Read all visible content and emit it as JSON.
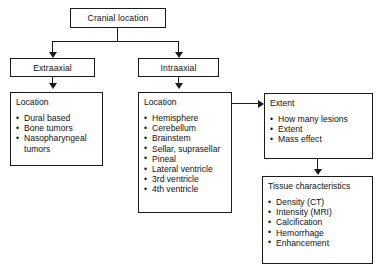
{
  "diagram": {
    "colors": {
      "stroke": "#1b1b1b",
      "text": "#111111",
      "background": "#ffffff"
    },
    "root": {
      "label": "Cranial location"
    },
    "branches": [
      {
        "label": "Extraaxial"
      },
      {
        "label": "Intraaxial"
      }
    ],
    "extraaxial_location": {
      "heading": "Location",
      "items": [
        "Dural based",
        "Bone tumors",
        "Nasopharyngeal tumors"
      ]
    },
    "intraaxial_location": {
      "heading": "Location",
      "items": [
        "Hemisphere",
        "Cerebellum",
        "Brainstem",
        "Sellar, suprasellar",
        "Pineal",
        "Lateral ventricle",
        "3rd ventricle",
        "4th ventricle"
      ]
    },
    "extent": {
      "heading": "Extent",
      "items": [
        "How many lesions",
        "Extent",
        "Mass effect"
      ]
    },
    "tissue_characteristics": {
      "heading": "Tissue characteristics",
      "items": [
        "Density (CT)",
        "Intensity (MRI)",
        "Calcification",
        "Hemorrhage",
        "Enhancement"
      ]
    }
  }
}
